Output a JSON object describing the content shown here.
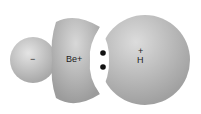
{
  "diagram": {
    "labels": {
      "left_charge": "−",
      "be_label": "Be+",
      "h_charge": "+",
      "h_label": "H"
    },
    "electron_pair_count": 2,
    "colors": {
      "cloud_light": "#d6d6d6",
      "cloud_dark": "#9a9a9a",
      "electron": "#111111",
      "background": "#ffffff"
    }
  }
}
